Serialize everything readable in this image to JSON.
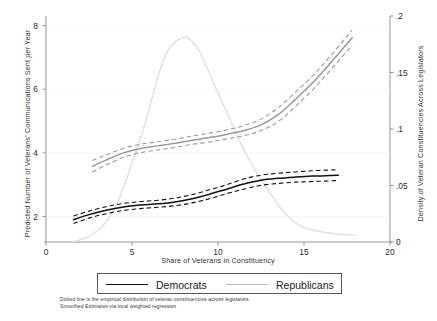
{
  "chart_data": {
    "type": "line",
    "title": "",
    "xlabel": "Share of Veterans in Constituency",
    "ylabel": "Predicted Number of Veterans' Communications Sent per Year",
    "ylabel_right": "Density of Veteran Constituencies Across Legislators",
    "xlim": [
      0,
      20
    ],
    "ylim": [
      1.2,
      8.3
    ],
    "ylim_right": [
      0,
      0.2
    ],
    "grid": false,
    "legend_position": "bottom-center",
    "xticks": [
      0,
      5,
      10,
      15,
      20
    ],
    "xtick_labels": [
      "0",
      "5",
      "10",
      "15",
      "20"
    ],
    "yticks_left": [
      2,
      4,
      6,
      8
    ],
    "ytick_labels_left": [
      "2",
      "4",
      "6",
      "8"
    ],
    "yticks_right": [
      0,
      0.05,
      0.1,
      0.15,
      0.2
    ],
    "ytick_labels_right": [
      "0",
      ".05",
      ".1",
      ".15",
      ".2"
    ],
    "series": [
      {
        "name": "Democrats",
        "style": "solid",
        "color": "#111111",
        "axis": "left",
        "x": [
          1.6,
          2.5,
          3.5,
          4.5,
          5.5,
          6.5,
          7.5,
          8.5,
          9.5,
          10.5,
          11.5,
          12.5,
          13.5,
          14.5,
          15.5,
          16.5,
          17.0
        ],
        "y": [
          1.9,
          2.06,
          2.2,
          2.3,
          2.36,
          2.4,
          2.46,
          2.56,
          2.7,
          2.86,
          3.02,
          3.14,
          3.2,
          3.24,
          3.27,
          3.29,
          3.3
        ],
        "ci_upper": [
          2.02,
          2.17,
          2.31,
          2.41,
          2.47,
          2.51,
          2.58,
          2.69,
          2.84,
          3.0,
          3.18,
          3.3,
          3.36,
          3.4,
          3.44,
          3.46,
          3.47
        ],
        "ci_lower": [
          1.78,
          1.95,
          2.09,
          2.19,
          2.25,
          2.29,
          2.34,
          2.43,
          2.56,
          2.72,
          2.86,
          2.98,
          3.04,
          3.08,
          3.1,
          3.12,
          3.13
        ]
      },
      {
        "name": "Republicans",
        "style": "solid",
        "color": "#9a9a9a",
        "axis": "left",
        "x": [
          2.7,
          3.5,
          4.5,
          5.5,
          6.5,
          7.5,
          8.5,
          9.5,
          10.5,
          11.5,
          12.5,
          13.5,
          14.5,
          15.5,
          16.5,
          17.8
        ],
        "y": [
          3.58,
          3.78,
          4.0,
          4.14,
          4.22,
          4.3,
          4.4,
          4.48,
          4.58,
          4.7,
          4.88,
          5.2,
          5.68,
          6.2,
          6.8,
          7.62
        ],
        "ci_upper": [
          3.76,
          3.94,
          4.14,
          4.27,
          4.35,
          4.43,
          4.53,
          4.62,
          4.72,
          4.86,
          5.06,
          5.42,
          5.9,
          6.42,
          7.02,
          7.86
        ],
        "ci_lower": [
          3.4,
          3.62,
          3.86,
          4.01,
          4.09,
          4.17,
          4.27,
          4.34,
          4.44,
          4.54,
          4.7,
          4.98,
          5.46,
          5.98,
          6.58,
          7.38
        ]
      },
      {
        "name": "Empirical density of veteran constituencies",
        "style": "dotted",
        "color": "#d8d8d8",
        "axis": "right",
        "x": [
          1.5,
          2.0,
          2.5,
          3.0,
          3.5,
          4.0,
          4.5,
          5.0,
          5.5,
          6.0,
          6.5,
          7.0,
          7.5,
          8.0,
          8.3,
          8.8,
          9.2,
          9.6,
          10.0,
          10.5,
          11.0,
          11.5,
          12.0,
          12.5,
          13.0,
          13.5,
          14.0,
          14.5,
          15.0,
          16.0,
          17.0,
          18.0
        ],
        "y": [
          0.0,
          0.002,
          0.005,
          0.01,
          0.018,
          0.03,
          0.048,
          0.07,
          0.092,
          0.118,
          0.146,
          0.167,
          0.177,
          0.181,
          0.18,
          0.172,
          0.16,
          0.146,
          0.132,
          0.115,
          0.098,
          0.082,
          0.068,
          0.055,
          0.044,
          0.033,
          0.024,
          0.017,
          0.013,
          0.009,
          0.007,
          0.006
        ]
      }
    ],
    "annotations": [
      "Dotted line is the empirical distribution of veteran constituencies across legislators.",
      "Smoothed Estimates via local weighted regression"
    ]
  },
  "legend": {
    "democrats_label": "Democrats",
    "republicans_label": "Republicans"
  },
  "footnotes": {
    "line1": "Dotted line is the empirical distribution of veteran constituencies across legislators.",
    "line2": "Smoothed Estimates via local weighted regression"
  }
}
